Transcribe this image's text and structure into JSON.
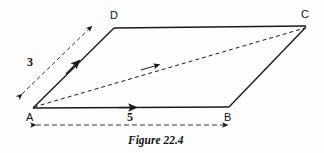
{
  "figure": {
    "caption": "Figure 22.4",
    "type": "parallelogram-vector-diagram",
    "background_color": "#fdfdfd",
    "stroke_color": "#1a1a1a",
    "vertices": [
      {
        "name": "A",
        "label": "A",
        "x": 33,
        "y": 108
      },
      {
        "name": "B",
        "label": "B",
        "x": 229,
        "y": 107
      },
      {
        "name": "C",
        "label": "C",
        "x": 306,
        "y": 27
      },
      {
        "name": "D",
        "label": "D",
        "x": 114,
        "y": 28
      }
    ],
    "edges": [
      {
        "name": "AB",
        "style": "solid",
        "arrow": "mid",
        "from": "A",
        "to": "B"
      },
      {
        "name": "AD",
        "style": "solid",
        "arrow": "mid",
        "from": "A",
        "to": "D"
      },
      {
        "name": "DC",
        "style": "solid",
        "arrow": "none",
        "from": "D",
        "to": "C"
      },
      {
        "name": "BC",
        "style": "solid",
        "arrow": "none",
        "from": "B",
        "to": "C"
      },
      {
        "name": "AC",
        "style": "dashed",
        "arrow": "mid",
        "from": "A",
        "to": "C"
      }
    ],
    "dimensions": [
      {
        "name": "side-AD-length",
        "label": "3",
        "style": "dashed",
        "arrows": "both"
      },
      {
        "name": "side-AB-length",
        "label": "5",
        "style": "dashed",
        "arrows": "both"
      }
    ]
  }
}
